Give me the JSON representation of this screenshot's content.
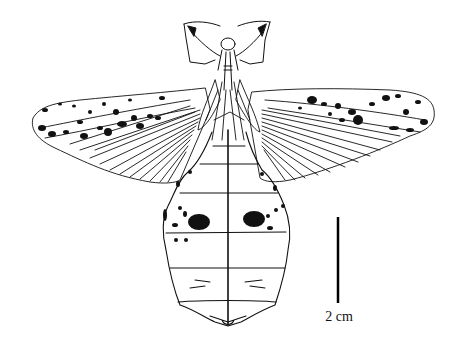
{
  "figure": {
    "line_color": "#111111",
    "background": "#ffffff",
    "scale_bar": {
      "label": "2 cm",
      "length_px": 86
    }
  }
}
